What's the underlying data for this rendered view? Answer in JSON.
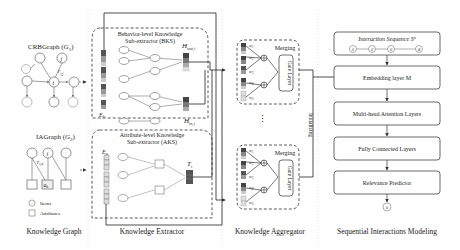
{
  "sections": {
    "knowledge_graph": "Knowledge Graph",
    "knowledge_extractor": "Knowledge Extractor",
    "knowledge_aggregator": "Knowledge Aggregator",
    "sequential": "Sequential Interactions Modeling"
  },
  "graph": {
    "crb_title": "CRBGraph (",
    "crb_sym": "G",
    "crb_sub": "1",
    "ia_title": "IAGraph (",
    "ia_sym": "G",
    "ia_sub": "2",
    "node_i": "i",
    "node_j": "j",
    "edge_rij": "r",
    "edge_rij_sub": "i,j",
    "edge_ria": "r",
    "edge_ria_sub": "i,a",
    "attr_node": "a",
    "attr_node_sub": "k",
    "legend_items": "Items",
    "legend_attributes": "Attributes"
  },
  "extractor": {
    "bks_line1": "Behavior-level Knowledge",
    "bks_line2": "Sub-extractor (BKS)",
    "aks_line1": "Attribute-level Knowledge",
    "aks_line2": "Sub-extractor (AKS)",
    "eb": "E",
    "eb_sub": "b",
    "ea": "E",
    "ea_sub": "a",
    "hout": "H",
    "hout_sub": "out,i",
    "hin": "H",
    "hin_sub": "in,i",
    "ti": "T",
    "ti_sub": "i"
  },
  "aggregator": {
    "merging": "Merging",
    "gate": "Gate Layer",
    "w1": "w",
    "w1_sub": "1",
    "w2": "w",
    "w2_sub": "2",
    "w3": "w",
    "w3_sub": "3",
    "w4": "w",
    "w4_sub": "4",
    "w5": "w",
    "w5_sub": "5",
    "dots": "⋮",
    "initializing": "Initializing"
  },
  "sequence": {
    "interaction": "Interaction Sequence S",
    "interaction_sup": "u",
    "embedding": "Embedding layer M",
    "attention": "Multi-head Attention Layers",
    "fully": "Fully Connected Layers",
    "relevance": "Relevance Predictor",
    "seq_nodes": [
      "i1",
      "i2",
      "i3",
      "i4"
    ],
    "output_node": "i5"
  },
  "colors": {
    "dark": "#555555",
    "mid": "#8a8a8a",
    "light": "#c8c8c8",
    "node_stroke": "#888888",
    "attr_fill": "#d9d9d9"
  }
}
